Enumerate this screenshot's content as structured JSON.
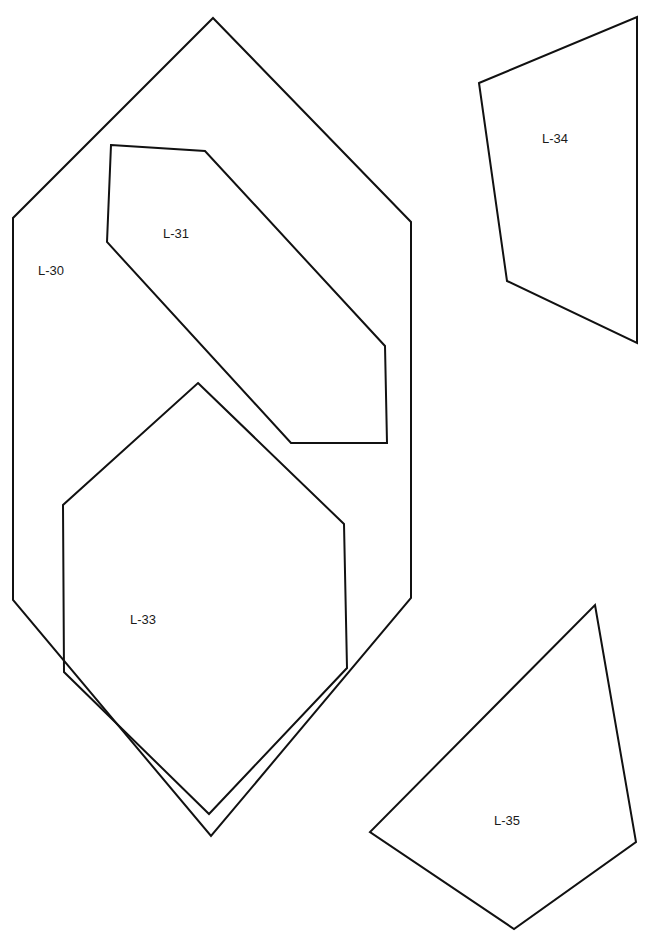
{
  "sheet": {
    "title": "Quilt pattern templates",
    "background": "#ffffff",
    "stroke_color": "#111111"
  },
  "pieces": [
    {
      "id": "L-30",
      "label": "L-30",
      "shape": "elongated hexagon"
    },
    {
      "id": "L-31",
      "label": "L-31",
      "shape": "irregular hexagon"
    },
    {
      "id": "L-33",
      "label": "L-33",
      "shape": "pentagon-hexagon"
    },
    {
      "id": "L-34",
      "label": "L-34",
      "shape": "quadrilateral"
    },
    {
      "id": "L-35",
      "label": "L-35",
      "shape": "quadrilateral"
    }
  ]
}
